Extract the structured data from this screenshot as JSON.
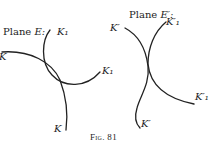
{
  "figure": {
    "caption": "Fig. 81",
    "left_panel": {
      "plane_label": "Plane",
      "plane_symbol": "E:",
      "labels": {
        "k1_top": "K₁",
        "k_left": "K",
        "k1_right": "K₁",
        "k_bottom": "K"
      }
    },
    "right_panel": {
      "plane_label": "Plane",
      "plane_symbol": "E′:",
      "labels": {
        "k_left": "K′",
        "k1_top": "K′₁",
        "k1_right": "K′₁",
        "k_bottom": "K′"
      }
    },
    "stroke_color": "#222222",
    "background": "#ffffff"
  }
}
